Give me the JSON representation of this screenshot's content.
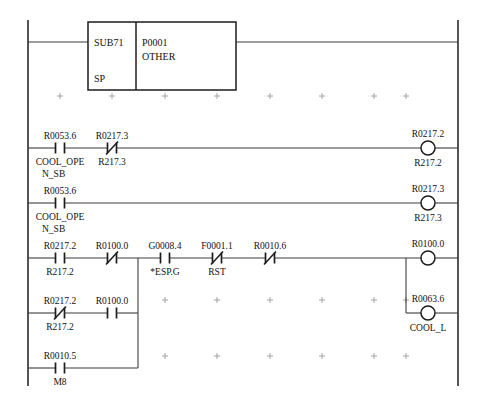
{
  "diagram": {
    "kind": "ladder-logic",
    "width": 485,
    "height": 399,
    "colors": {
      "background": "#ffffff",
      "wire": "#3c3c3c",
      "rail": "#2a2a2a",
      "symbol": "#1c1c1c",
      "grid_mark": "#9a9a9a",
      "text": "#111111"
    },
    "rails": {
      "left_x": 28,
      "right_x": 458,
      "top_y": 20,
      "bottom_y": 386
    },
    "grid": {
      "visible": true,
      "mark": "+",
      "columns_x": [
        60,
        112,
        165,
        217,
        270,
        322,
        374,
        406
      ],
      "rows_y": [
        96,
        300,
        356
      ]
    }
  },
  "function_block": {
    "name": "function-block-sub71",
    "x": 88,
    "y": 22,
    "width": 148,
    "height": 68,
    "divider_x": 136,
    "left_top_label": "SUB71",
    "left_bottom_label": "SP",
    "right_line1": "P0001",
    "right_line2": "OTHER",
    "input_wire_y": 42,
    "output_wire_y": 42
  },
  "rungs": [
    {
      "id": "rung-1",
      "name": "rung-function-block",
      "y": 42,
      "elements": [],
      "output": null
    },
    {
      "id": "rung-2",
      "name": "rung-cool-open-sb-to-r217-2",
      "y": 148,
      "elements": [
        {
          "name": "contact-r0053-6",
          "type": "contact-no",
          "x": 60,
          "top_label": "R0053.6",
          "bottom_label_line1": "COOL_OPE",
          "bottom_label_line2": "N_SB"
        },
        {
          "name": "contact-r0217-3",
          "type": "contact-nc",
          "x": 112,
          "top_label": "R0217.3",
          "bottom_label_line1": "R217.3",
          "bottom_label_line2": ""
        }
      ],
      "output": {
        "name": "coil-r0217-2",
        "type": "coil",
        "x": 428,
        "top_label": "R0217.2",
        "bottom_label": "R217.2"
      }
    },
    {
      "id": "rung-3",
      "name": "rung-cool-open-sb-to-r217-3",
      "y": 203,
      "elements": [
        {
          "name": "contact-r0053-6-second",
          "type": "contact-no",
          "x": 60,
          "top_label": "R0053.6",
          "bottom_label_line1": "COOL_OPE",
          "bottom_label_line2": "N_SB"
        }
      ],
      "output": {
        "name": "coil-r0217-3",
        "type": "coil",
        "x": 428,
        "top_label": "R0217.3",
        "bottom_label": "R217.3"
      }
    },
    {
      "id": "rung-4",
      "name": "rung-esp-rst-to-r0100-0",
      "y": 258,
      "elements": [
        {
          "name": "contact-r0217-2",
          "type": "contact-no",
          "x": 60,
          "top_label": "R0217.2",
          "bottom_label_line1": "R217.2",
          "bottom_label_line2": ""
        },
        {
          "name": "contact-r0100-0",
          "type": "contact-nc",
          "x": 112,
          "top_label": "R0100.0",
          "bottom_label_line1": "",
          "bottom_label_line2": ""
        },
        {
          "name": "contact-g0008-4",
          "type": "contact-no",
          "x": 165,
          "top_label": "G0008.4",
          "bottom_label_line1": "*ESP.G",
          "bottom_label_line2": ""
        },
        {
          "name": "contact-f0001-1",
          "type": "contact-nc",
          "x": 217,
          "top_label": "F0001.1",
          "bottom_label_line1": "RST",
          "bottom_label_line2": ""
        },
        {
          "name": "contact-r0010-6",
          "type": "contact-nc",
          "x": 270,
          "top_label": "R0010.6",
          "bottom_label_line1": "",
          "bottom_label_line2": ""
        }
      ],
      "output": {
        "name": "coil-r0100-0",
        "type": "coil",
        "x": 428,
        "top_label": "R0100.0",
        "bottom_label": ""
      }
    },
    {
      "id": "rung-5",
      "name": "rung-seal-in-branch",
      "y": 313,
      "elements": [
        {
          "name": "contact-r0217-2-nc",
          "type": "contact-nc",
          "x": 60,
          "top_label": "R0217.2",
          "bottom_label_line1": "R217.2",
          "bottom_label_line2": ""
        },
        {
          "name": "contact-r0100-0-no",
          "type": "contact-no",
          "x": 112,
          "top_label": "R0100.0",
          "bottom_label_line1": "",
          "bottom_label_line2": ""
        }
      ],
      "output": {
        "name": "coil-r0063-6",
        "type": "coil",
        "x": 428,
        "top_label": "R0063.6",
        "bottom_label": "COOL_L"
      }
    },
    {
      "id": "rung-6",
      "name": "rung-m8-branch",
      "y": 368,
      "elements": [
        {
          "name": "contact-r0010-5",
          "type": "contact-no",
          "x": 60,
          "top_label": "R0010.5",
          "bottom_label_line1": "M8",
          "bottom_label_line2": ""
        }
      ],
      "output": null
    }
  ],
  "branch_links": [
    {
      "name": "branch-vertical-left",
      "x": 138,
      "y_top": 258,
      "y_bottom": 368
    },
    {
      "name": "branch-vertical-right",
      "x": 406,
      "y_top": 258,
      "y_bottom": 313
    }
  ]
}
